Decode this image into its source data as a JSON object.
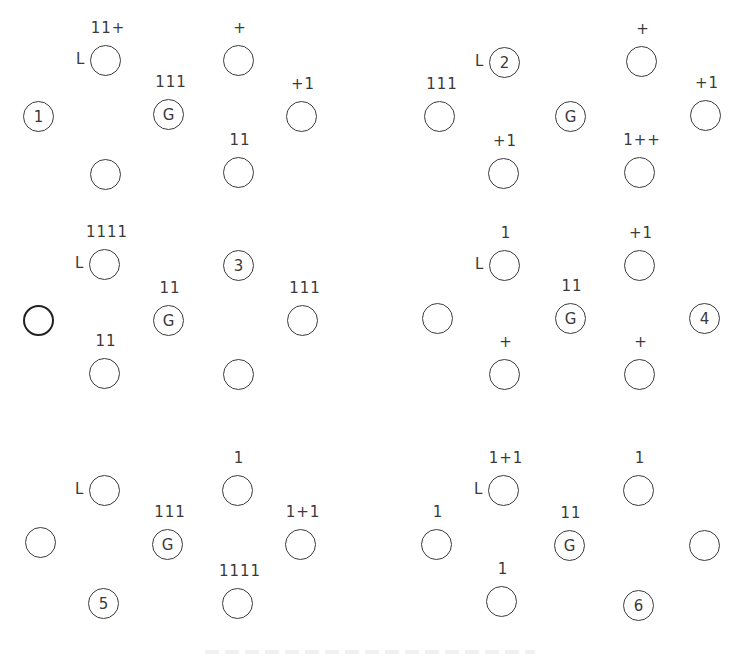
{
  "panels": [
    {
      "id": 1,
      "nodes": [
        {
          "key": "left",
          "text": "1",
          "label": ""
        },
        {
          "key": "upper_left",
          "text": "",
          "label": "11+",
          "side": "L"
        },
        {
          "key": "center",
          "text": "G",
          "label": "111"
        },
        {
          "key": "upper_right",
          "text": "",
          "label": "+"
        },
        {
          "key": "right",
          "text": "",
          "label": "+1"
        },
        {
          "key": "lower_left",
          "text": "",
          "label": ""
        },
        {
          "key": "lower_right",
          "text": "",
          "label": "11"
        }
      ]
    },
    {
      "id": 2,
      "nodes": [
        {
          "key": "left",
          "text": "",
          "label": "111"
        },
        {
          "key": "upper_left",
          "text": "2",
          "label": "",
          "side": "L"
        },
        {
          "key": "center",
          "text": "G",
          "label": ""
        },
        {
          "key": "upper_right",
          "text": "",
          "label": "+"
        },
        {
          "key": "right",
          "text": "",
          "label": "+1"
        },
        {
          "key": "lower_left",
          "text": "",
          "label": "+1"
        },
        {
          "key": "lower_right",
          "text": "",
          "label": "1++"
        }
      ]
    },
    {
      "id": 3,
      "nodes": [
        {
          "key": "left",
          "text": "",
          "label": ""
        },
        {
          "key": "upper_left",
          "text": "",
          "label": "1111",
          "side": "L"
        },
        {
          "key": "center",
          "text": "G",
          "label": "11"
        },
        {
          "key": "upper_right",
          "text": "3",
          "label": ""
        },
        {
          "key": "right",
          "text": "",
          "label": "111"
        },
        {
          "key": "lower_left",
          "text": "",
          "label": "11"
        },
        {
          "key": "lower_right",
          "text": "",
          "label": ""
        }
      ]
    },
    {
      "id": 4,
      "nodes": [
        {
          "key": "left",
          "text": "",
          "label": ""
        },
        {
          "key": "upper_left",
          "text": "",
          "label": "1",
          "side": "L"
        },
        {
          "key": "center",
          "text": "G",
          "label": "11"
        },
        {
          "key": "upper_right",
          "text": "",
          "label": "+1"
        },
        {
          "key": "right",
          "text": "4",
          "label": ""
        },
        {
          "key": "lower_left",
          "text": "",
          "label": "+"
        },
        {
          "key": "lower_right",
          "text": "",
          "label": "+"
        }
      ]
    },
    {
      "id": 5,
      "nodes": [
        {
          "key": "left",
          "text": "",
          "label": ""
        },
        {
          "key": "upper_left",
          "text": "",
          "label": "",
          "side": "L"
        },
        {
          "key": "center",
          "text": "G",
          "label": "111"
        },
        {
          "key": "upper_right",
          "text": "",
          "label": "1"
        },
        {
          "key": "right",
          "text": "",
          "label": "1+1"
        },
        {
          "key": "lower_left",
          "text": "5",
          "label": ""
        },
        {
          "key": "lower_right",
          "text": "",
          "label": "1111"
        }
      ]
    },
    {
      "id": 6,
      "nodes": [
        {
          "key": "left",
          "text": "",
          "label": "1"
        },
        {
          "key": "upper_left",
          "text": "",
          "label": "1+1",
          "side": "L"
        },
        {
          "key": "center",
          "text": "G",
          "label": "11"
        },
        {
          "key": "upper_right",
          "text": "",
          "label": "1"
        },
        {
          "key": "right",
          "text": "",
          "label": ""
        },
        {
          "key": "lower_left",
          "text": "",
          "label": "1"
        },
        {
          "key": "lower_right",
          "text": "6",
          "label": ""
        }
      ]
    }
  ],
  "colors": {
    "stroke": "#3c3c3c",
    "text": "#3a3a3a",
    "background": "#ffffff"
  }
}
